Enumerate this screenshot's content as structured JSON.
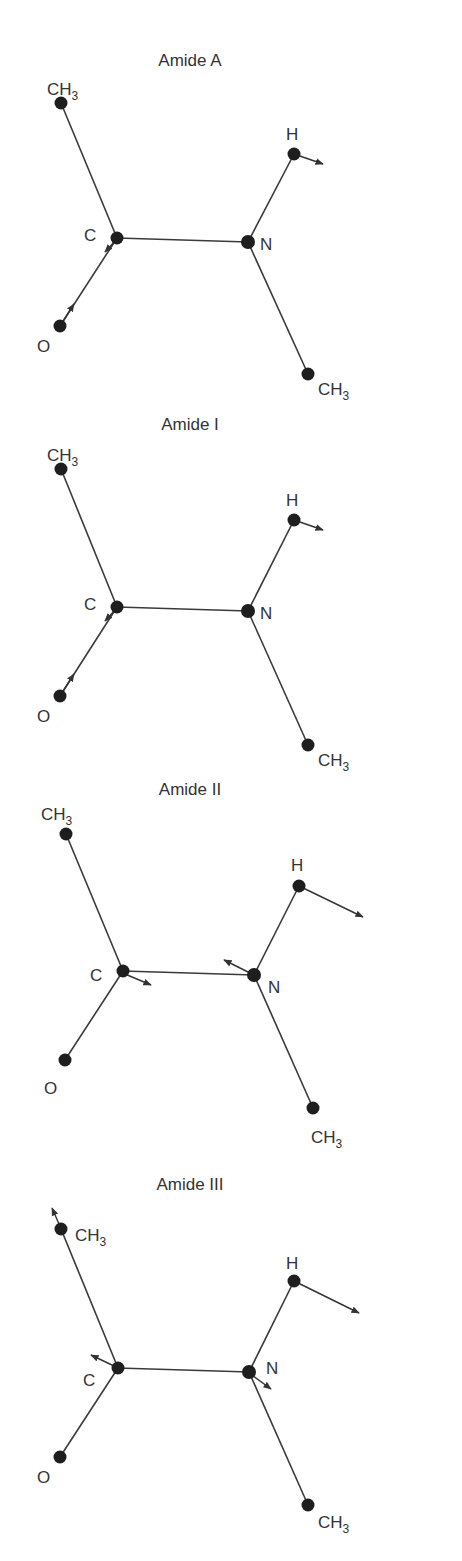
{
  "figure": {
    "panels": [
      {
        "title": "Amide A",
        "atoms": {
          "ch3_top": {
            "label": "CH",
            "sub": "3"
          },
          "c": {
            "label": "C"
          },
          "n": {
            "label": "N"
          },
          "h": {
            "label": "H"
          },
          "o": {
            "label": "O"
          },
          "ch3_bottom": {
            "label": "CH",
            "sub": "3"
          }
        }
      },
      {
        "title": "Amide I",
        "atoms": {
          "ch3_top": {
            "label": "CH",
            "sub": "3"
          },
          "c": {
            "label": "C"
          },
          "n": {
            "label": "N"
          },
          "h": {
            "label": "H"
          },
          "o": {
            "label": "O"
          },
          "ch3_bottom": {
            "label": "CH",
            "sub": "3"
          }
        }
      },
      {
        "title": "Amide II",
        "atoms": {
          "ch3_top": {
            "label": "CH",
            "sub": "3"
          },
          "c": {
            "label": "C"
          },
          "n": {
            "label": "N"
          },
          "h": {
            "label": "H"
          },
          "o": {
            "label": "O"
          },
          "ch3_bottom": {
            "label": "CH",
            "sub": "3"
          }
        }
      },
      {
        "title": "Amide III",
        "atoms": {
          "ch3_top": {
            "label": "CH",
            "sub": "3"
          },
          "c": {
            "label": "C"
          },
          "n": {
            "label": "N"
          },
          "h": {
            "label": "H"
          },
          "o": {
            "label": "O"
          },
          "ch3_bottom": {
            "label": "CH",
            "sub": "3"
          }
        }
      }
    ]
  }
}
